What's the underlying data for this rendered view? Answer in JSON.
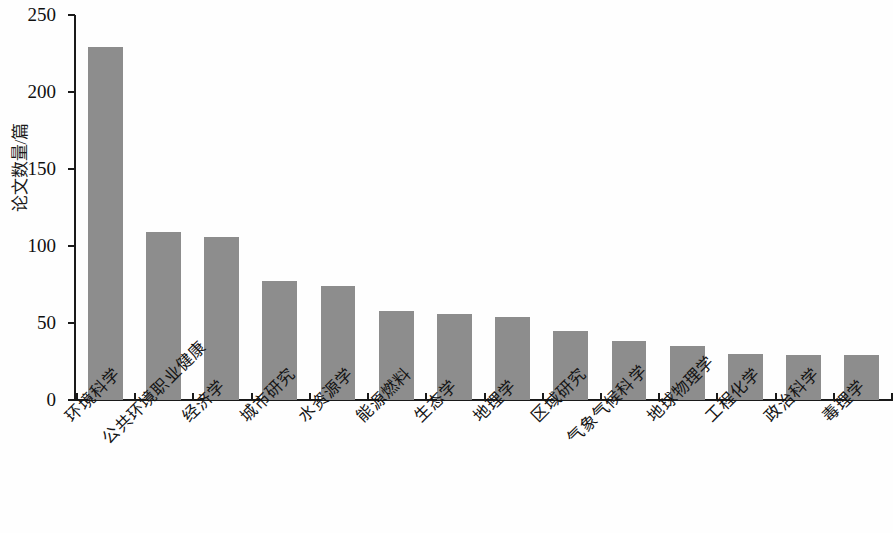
{
  "chart_data": {
    "type": "bar",
    "title": "",
    "subtitle": "",
    "xlabel": "",
    "ylabel": "论文数量/篇",
    "ylim": [
      0,
      250
    ],
    "ytick_labels": [
      "0",
      "50",
      "100",
      "150",
      "200",
      "250"
    ],
    "ytick_values": [
      0,
      50,
      100,
      150,
      200,
      250
    ],
    "grid": false,
    "legend": false,
    "bar_color": "#8d8d8d",
    "axis_color": "#1a1a1a",
    "categories": [
      "环境科学",
      "公共环境职业健康",
      "经济学",
      "城市研究",
      "水资源学",
      "能源燃料",
      "生态学",
      "地理学",
      "区域研究",
      "气象气候科学",
      "地球物理学",
      "工程化学",
      "政治科学",
      "毒理学"
    ],
    "values": [
      229,
      109,
      106,
      77,
      74,
      58,
      56,
      54,
      45,
      38,
      35,
      30,
      29,
      29
    ]
  }
}
